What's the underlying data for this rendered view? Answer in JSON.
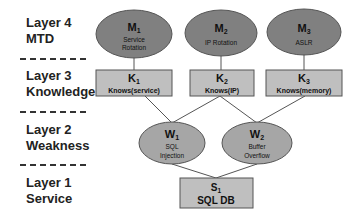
{
  "layers": [
    {
      "line1": "Layer 4",
      "line2": "MTD"
    },
    {
      "line1": "Layer 3",
      "line2": "Knowledge"
    },
    {
      "line1": "Layer 2",
      "line2": "Weakness"
    },
    {
      "line1": "Layer 1",
      "line2": "Service"
    }
  ],
  "nodes": {
    "m1": {
      "id": "M",
      "sub": "1",
      "line1": "Service",
      "line2": "Rotation"
    },
    "m2": {
      "id": "M",
      "sub": "2",
      "line1": "IP Rotation"
    },
    "m3": {
      "id": "M",
      "sub": "3",
      "line1": "ASLR"
    },
    "k1": {
      "id": "K",
      "sub": "1",
      "line1": "Knows(service)"
    },
    "k2": {
      "id": "K",
      "sub": "2",
      "line1": "Knows(IP)"
    },
    "k3": {
      "id": "K",
      "sub": "3",
      "line1": "Knows(memory)"
    },
    "w1": {
      "id": "W",
      "sub": "1",
      "line1": "SQL",
      "line2": "Injection"
    },
    "w2": {
      "id": "W",
      "sub": "2",
      "line1": "Buffer",
      "line2": "Overflow"
    },
    "s1": {
      "id": "S",
      "sub": "1",
      "line1": "SQL DB"
    }
  },
  "colors": {
    "ellipse_fill": "#808080",
    "box_fill": "#bfbfbf",
    "stroke": "#555555"
  }
}
